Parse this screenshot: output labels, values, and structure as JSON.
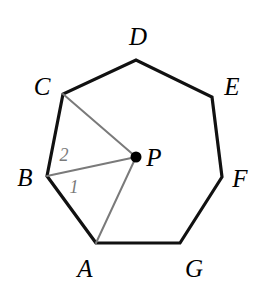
{
  "figure": {
    "type": "geometry-diagram",
    "shape": "regular heptagon with interior center point",
    "background_color": "#ffffff",
    "outline_color": "#111111",
    "ray_color": "#7a7a7a",
    "label_color": "#000000",
    "angle_label_color": "#7a7a7a",
    "center_point_color": "#000000",
    "outline_stroke_width": 3.2,
    "ray_stroke_width": 2.0,
    "center_dot_radius": 5.5
  },
  "polygon": {
    "name": "ABCDEFG",
    "vertex_count": 7,
    "vertices": [
      {
        "label": "A",
        "x": 96,
        "y": 243,
        "label_x": 85,
        "label_y": 268
      },
      {
        "label": "B",
        "x": 47,
        "y": 176,
        "label_x": 25,
        "label_y": 177
      },
      {
        "label": "C",
        "x": 63,
        "y": 94,
        "label_x": 42,
        "label_y": 86
      },
      {
        "label": "D",
        "x": 136,
        "y": 60,
        "label_x": 138,
        "label_y": 36
      },
      {
        "label": "E",
        "x": 212,
        "y": 97,
        "label_x": 232,
        "label_y": 86
      },
      {
        "label": "F",
        "x": 222,
        "y": 177,
        "label_x": 240,
        "label_y": 178
      },
      {
        "label": "G",
        "x": 180,
        "y": 243,
        "label_x": 194,
        "label_y": 268
      }
    ]
  },
  "center": {
    "label": "P",
    "x": 136,
    "y": 157,
    "label_x": 154,
    "label_y": 157
  },
  "rays": [
    {
      "name": "PC",
      "from": "P",
      "to": "C"
    },
    {
      "name": "PB",
      "from": "P",
      "to": "B"
    },
    {
      "name": "PA",
      "from": "P",
      "to": "A"
    }
  ],
  "angle_labels": [
    {
      "label": "2",
      "x": 64,
      "y": 155,
      "describes": "angle BPC region near vertex B"
    },
    {
      "label": "1",
      "x": 74,
      "y": 187,
      "describes": "angle APB region near vertex B"
    }
  ]
}
